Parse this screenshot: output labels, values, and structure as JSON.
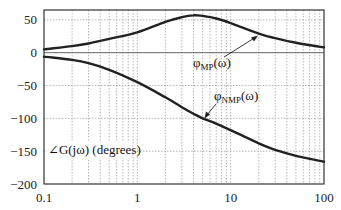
{
  "chart_data": {
    "type": "line",
    "title": "",
    "xlabel": "",
    "ylabel": "∠G(jω) (degrees)",
    "xscale": "log",
    "xlim": [
      0.1,
      100
    ],
    "ylim": [
      -200,
      65
    ],
    "xticks": [
      0.1,
      1,
      10,
      100
    ],
    "xtick_labels": [
      "0.1",
      "1",
      "10",
      "100"
    ],
    "yticks": [
      50,
      0,
      -50,
      -100,
      -150,
      -200
    ],
    "ytick_labels": [
      "50",
      "0",
      "-50",
      "-100",
      "-150",
      "-200"
    ],
    "grid": true,
    "legend": "none (curves annotated with arrows)",
    "series": [
      {
        "name": "φMP(ω)",
        "label_main": "φ",
        "label_sub": "MP",
        "label_suffix": "(ω)",
        "x": [
          0.1,
          0.2,
          0.3,
          0.5,
          1,
          2,
          3,
          4,
          5,
          7,
          10,
          20,
          30,
          50,
          100
        ],
        "values": [
          5,
          10,
          14,
          21,
          31,
          47,
          54,
          57,
          56,
          52,
          45,
          29,
          22,
          15,
          8
        ]
      },
      {
        "name": "φNMP(ω)",
        "label_main": "φ",
        "label_sub": "NMP",
        "label_suffix": "(ω)",
        "x": [
          0.1,
          0.2,
          0.3,
          0.5,
          1,
          2,
          3,
          4,
          5,
          7,
          10,
          20,
          30,
          50,
          100
        ],
        "values": [
          -6,
          -11,
          -16,
          -26,
          -45,
          -68,
          -83,
          -93,
          -100,
          -108,
          -118,
          -138,
          -148,
          -157,
          -166
        ]
      }
    ],
    "annotations": [
      {
        "text": "φMP(ω)",
        "arrow_to": {
          "x": 12,
          "y": 40
        }
      },
      {
        "text": "φNMP(ω)",
        "arrow_to": {
          "x": 4,
          "y": -95
        }
      }
    ]
  }
}
